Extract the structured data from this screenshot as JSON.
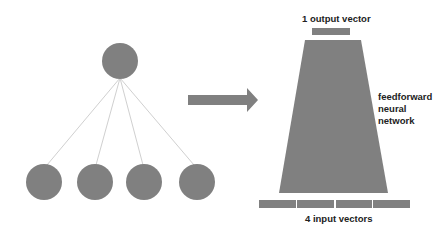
{
  "colors": {
    "shape": "#808080",
    "line": "#d0d0d0",
    "text": "#222222"
  },
  "tree": {
    "root": {
      "cx": 120,
      "cy": 61,
      "r": 18
    },
    "leaves": [
      {
        "cx": 44,
        "cy": 182,
        "r": 18
      },
      {
        "cx": 95,
        "cy": 182,
        "r": 18
      },
      {
        "cx": 144,
        "cy": 182,
        "r": 18
      },
      {
        "cx": 197,
        "cy": 182,
        "r": 18
      }
    ]
  },
  "arrow": {
    "direction": "right"
  },
  "network": {
    "output_label": "1 output vector",
    "input_label": "4 input vectors",
    "name_lines": [
      "feedforward",
      "neural",
      "network"
    ],
    "input_count": 4,
    "output_count": 1
  }
}
